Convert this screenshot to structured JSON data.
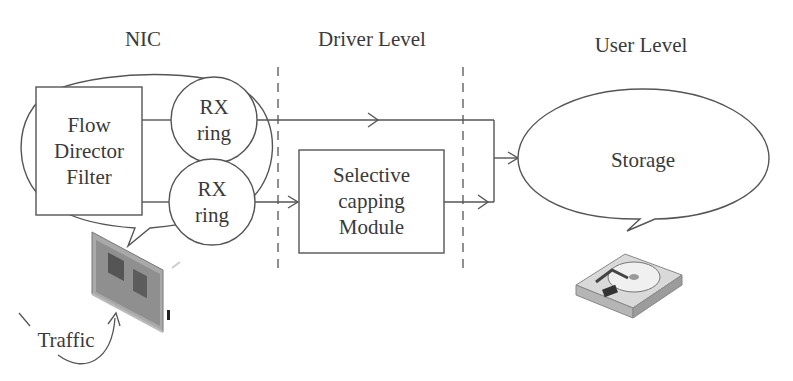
{
  "headings": {
    "nic": "NIC",
    "driver_level": "Driver Level",
    "user_level": "User Level"
  },
  "nodes": {
    "flow_director": "Flow\nDirector\nFilter",
    "rx_ring_1": "RX\nring",
    "rx_ring_2": "RX\nring",
    "selective_capping": "Selective\ncapping\nModule",
    "storage": "Storage",
    "traffic": "Traffic"
  },
  "icons": {
    "nic_card": "network-card-icon",
    "hard_drive": "hard-drive-icon"
  },
  "colors": {
    "stroke": "#555555",
    "text": "#3a3a3a",
    "background": "#ffffff"
  }
}
